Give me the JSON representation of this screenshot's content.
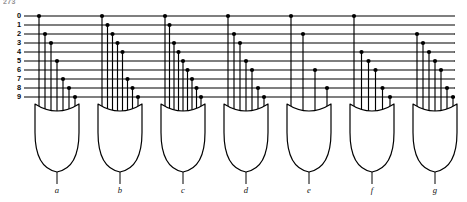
{
  "figure": {
    "corner_text": "273",
    "type": "logic-diagram",
    "ink_color": "#000000",
    "background_color": "#ffffff"
  },
  "inputs": {
    "label_title": "decimal inputs",
    "rows": [
      {
        "label": "0",
        "y": 16
      },
      {
        "label": "1",
        "y": 25
      },
      {
        "label": "2",
        "y": 34
      },
      {
        "label": "3",
        "y": 43
      },
      {
        "label": "4",
        "y": 52
      },
      {
        "label": "5",
        "y": 61
      },
      {
        "label": "6",
        "y": 70
      },
      {
        "label": "7",
        "y": 79
      },
      {
        "label": "8",
        "y": 88
      },
      {
        "label": "9",
        "y": 97
      }
    ],
    "bus_start_x": 24,
    "bus_end_x": 455
  },
  "gates": [
    {
      "id": "a",
      "label": "a",
      "cx": 57,
      "inputs": [
        "0",
        "2",
        "3",
        "5",
        "7",
        "8",
        "9"
      ]
    },
    {
      "id": "b",
      "label": "b",
      "cx": 120,
      "inputs": [
        "0",
        "1",
        "2",
        "3",
        "4",
        "7",
        "8",
        "9"
      ]
    },
    {
      "id": "c",
      "label": "c",
      "cx": 183,
      "inputs": [
        "0",
        "1",
        "3",
        "4",
        "5",
        "6",
        "7",
        "8",
        "9"
      ]
    },
    {
      "id": "d",
      "label": "d",
      "cx": 246,
      "inputs": [
        "0",
        "2",
        "3",
        "5",
        "6",
        "8",
        "9"
      ]
    },
    {
      "id": "e",
      "label": "e",
      "cx": 309,
      "inputs": [
        "0",
        "2",
        "6",
        "8"
      ]
    },
    {
      "id": "f",
      "label": "f",
      "cx": 372,
      "inputs": [
        "0",
        "4",
        "5",
        "6",
        "8",
        "9"
      ]
    },
    {
      "id": "g",
      "label": "g",
      "cx": 435,
      "inputs": [
        "2",
        "3",
        "4",
        "5",
        "6",
        "8",
        "9"
      ]
    }
  ],
  "outputs": {
    "labels": [
      "a",
      "b",
      "c",
      "d",
      "e",
      "f",
      "g"
    ],
    "label_y": 193
  },
  "geometry": {
    "gate_top_y": 104,
    "gate_bottom_y": 172,
    "gate_half_width": 22,
    "gate_cusp_depth": 7,
    "output_stub_y": 184,
    "junction_radius": 2.1
  }
}
